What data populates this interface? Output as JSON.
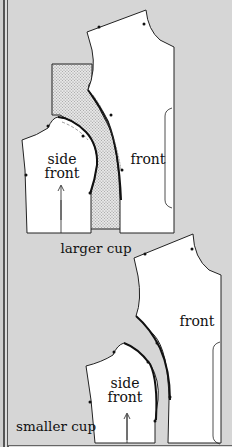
{
  "figure": {
    "top_panel": {
      "caption": "larger cup",
      "pieces": {
        "side_front_line1": "side",
        "side_front_line2": "front",
        "front": "front"
      }
    },
    "bottom_panel": {
      "caption": "smaller cup",
      "pieces": {
        "side_front_line1": "side",
        "side_front_line2": "front",
        "front": "front"
      }
    },
    "colors": {
      "background": "#d6d6d6",
      "piece_fill": "#ffffff",
      "outline": "#222222",
      "hatch": "#9a9a9a"
    }
  }
}
